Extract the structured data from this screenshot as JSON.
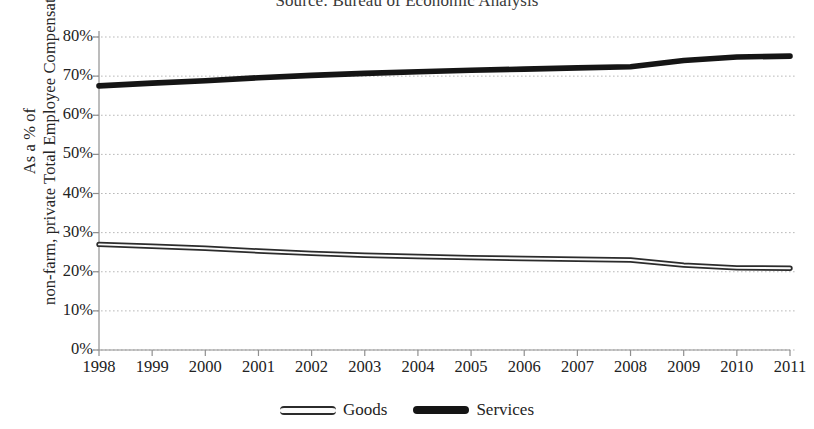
{
  "source_note": "Source: Bureau of Economic Analysis",
  "axis": {
    "y_title_line1": "As a % of",
    "y_title_line2": "non-farm, private Total Employee Compensation",
    "y_ticks": [
      "0%",
      "10%",
      "20%",
      "30%",
      "40%",
      "50%",
      "60%",
      "70%",
      "80%"
    ],
    "x_ticks": [
      "1998",
      "1999",
      "2000",
      "2001",
      "2002",
      "2003",
      "2004",
      "2005",
      "2006",
      "2007",
      "2008",
      "2009",
      "2010",
      "2011"
    ]
  },
  "legend": {
    "items": [
      {
        "label": "Goods",
        "style": "outlined",
        "color": "#2b2b2b"
      },
      {
        "label": "Services",
        "style": "solid",
        "color": "#151515"
      }
    ]
  },
  "chart_data": {
    "type": "line",
    "title": "Source: Bureau of Economic Analysis",
    "xlabel": "",
    "ylabel": "As a % of non-farm, private Total Employee Compensation",
    "x": [
      1998,
      1999,
      2000,
      2001,
      2002,
      2003,
      2004,
      2005,
      2006,
      2007,
      2008,
      2009,
      2010,
      2011
    ],
    "categories": [
      "1998",
      "1999",
      "2000",
      "2001",
      "2002",
      "2003",
      "2004",
      "2005",
      "2006",
      "2007",
      "2008",
      "2009",
      "2010",
      "2011"
    ],
    "series": [
      {
        "name": "Services",
        "color": "#151515",
        "values": [
          67.5,
          68.2,
          68.8,
          69.6,
          70.2,
          70.7,
          71.1,
          71.5,
          71.8,
          72.1,
          72.4,
          74.0,
          74.9,
          75.1
        ]
      },
      {
        "name": "Goods",
        "color": "#2b2b2b",
        "values": [
          27.0,
          26.5,
          26.0,
          25.3,
          24.7,
          24.2,
          23.9,
          23.6,
          23.4,
          23.2,
          23.0,
          21.7,
          21.0,
          20.9
        ]
      }
    ],
    "ylim": [
      0,
      80
    ],
    "ytick_step": 10,
    "ytick_format": "percent",
    "xlim": [
      1998,
      2011
    ],
    "grid": "horizontal-dotted",
    "legend_position": "bottom-center"
  }
}
